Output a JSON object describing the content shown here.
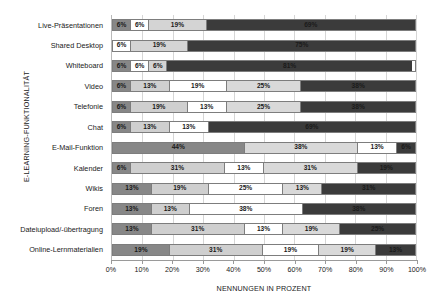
{
  "chart_data": {
    "type": "bar",
    "orientation": "horizontal",
    "stacked": true,
    "normalized_percent": true,
    "title": "",
    "xlabel": "NENNUNGEN IN PROZENT",
    "ylabel": "E-LEARNING-FUNKTIONALITÄT",
    "xlim": [
      0,
      100
    ],
    "xticks": [
      0,
      10,
      20,
      30,
      40,
      50,
      60,
      70,
      80,
      90,
      100
    ],
    "xticklabels": [
      "0%",
      "10%",
      "20%",
      "30%",
      "40%",
      "50%",
      "60%",
      "70%",
      "80%",
      "90%",
      "100%"
    ],
    "grid": true,
    "grid_axis": "x",
    "legend": false,
    "categories": [
      "Live-Präsentationen",
      "Shared Desktop",
      "Whiteboard",
      "Video",
      "Telefonie",
      "Chat",
      "E-Mail-Funktion",
      "Kalender",
      "Wikis",
      "Foren",
      "Dateiupload/-übertragung",
      "Online-Lernmaterialien"
    ],
    "series": [
      {
        "name": "series-1",
        "color": "#878787"
      },
      {
        "name": "series-2",
        "color": "#cfcfcf"
      },
      {
        "name": "series-3",
        "color": "#ffffff"
      },
      {
        "name": "series-4",
        "color": "#d9d9d9"
      },
      {
        "name": "series-5",
        "color": "#3b3b3b"
      }
    ],
    "rows": [
      {
        "category": "Live-Präsentationen",
        "segments": [
          {
            "series": 0,
            "value": 6,
            "label": "6%",
            "color": "#878787",
            "text_color": "#1a1a1a"
          },
          {
            "series": 1,
            "value": 6,
            "label": "6%",
            "color": "#ffffff",
            "text_color": "#1a1a1a"
          },
          {
            "series": 2,
            "value": 19,
            "label": "19%",
            "color": "#d4d4d4",
            "text_color": "#1a1a1a"
          },
          {
            "series": 4,
            "value": 69,
            "label": "69%",
            "color": "#3b3b3b",
            "text_color": "#1a1a1a"
          }
        ]
      },
      {
        "category": "Shared Desktop",
        "segments": [
          {
            "series": 0,
            "value": 6,
            "label": "6%",
            "color": "#ffffff",
            "text_color": "#1a1a1a"
          },
          {
            "series": 1,
            "value": 19,
            "label": "19%",
            "color": "#d4d4d4",
            "text_color": "#1a1a1a"
          },
          {
            "series": 4,
            "value": 75,
            "label": "75%",
            "color": "#3b3b3b",
            "text_color": "#1a1a1a"
          }
        ]
      },
      {
        "category": "Whiteboard",
        "segments": [
          {
            "series": 0,
            "value": 6,
            "label": "6%",
            "color": "#878787",
            "text_color": "#1a1a1a"
          },
          {
            "series": 1,
            "value": 6,
            "label": "6%",
            "color": "#ffffff",
            "text_color": "#1a1a1a"
          },
          {
            "series": 2,
            "value": 6,
            "label": "6%",
            "color": "#d4d4d4",
            "text_color": "#1a1a1a"
          },
          {
            "series": 4,
            "value": 81,
            "label": "81%",
            "color": "#3b3b3b",
            "text_color": "#1a1a1a"
          }
        ]
      },
      {
        "category": "Video",
        "segments": [
          {
            "series": 0,
            "value": 6,
            "label": "6%",
            "color": "#878787",
            "text_color": "#1a1a1a"
          },
          {
            "series": 1,
            "value": 13,
            "label": "13%",
            "color": "#cfcfcf",
            "text_color": "#1a1a1a"
          },
          {
            "series": 2,
            "value": 19,
            "label": "19%",
            "color": "#ffffff",
            "text_color": "#1a1a1a"
          },
          {
            "series": 3,
            "value": 25,
            "label": "25%",
            "color": "#d9d9d9",
            "text_color": "#1a1a1a"
          },
          {
            "series": 4,
            "value": 38,
            "label": "38%",
            "color": "#3b3b3b",
            "text_color": "#1a1a1a"
          }
        ]
      },
      {
        "category": "Telefonie",
        "segments": [
          {
            "series": 0,
            "value": 6,
            "label": "6%",
            "color": "#878787",
            "text_color": "#1a1a1a"
          },
          {
            "series": 1,
            "value": 19,
            "label": "19%",
            "color": "#cfcfcf",
            "text_color": "#1a1a1a"
          },
          {
            "series": 2,
            "value": 13,
            "label": "13%",
            "color": "#ffffff",
            "text_color": "#1a1a1a"
          },
          {
            "series": 3,
            "value": 25,
            "label": "25%",
            "color": "#d9d9d9",
            "text_color": "#1a1a1a"
          },
          {
            "series": 4,
            "value": 38,
            "label": "38%",
            "color": "#3b3b3b",
            "text_color": "#1a1a1a"
          }
        ]
      },
      {
        "category": "Chat",
        "segments": [
          {
            "series": 0,
            "value": 6,
            "label": "6%",
            "color": "#878787",
            "text_color": "#1a1a1a"
          },
          {
            "series": 1,
            "value": 13,
            "label": "13%",
            "color": "#cfcfcf",
            "text_color": "#1a1a1a"
          },
          {
            "series": 2,
            "value": 13,
            "label": "13%",
            "color": "#ffffff",
            "text_color": "#1a1a1a"
          },
          {
            "series": 4,
            "value": 69,
            "label": "69%",
            "color": "#3b3b3b",
            "text_color": "#1a1a1a"
          }
        ]
      },
      {
        "category": "E-Mail-Funktion",
        "segments": [
          {
            "series": 0,
            "value": 44,
            "label": "44%",
            "color": "#878787",
            "text_color": "#1a1a1a"
          },
          {
            "series": 1,
            "value": 38,
            "label": "38%",
            "color": "#d9d9d9",
            "text_color": "#1a1a1a"
          },
          {
            "series": 2,
            "value": 13,
            "label": "13%",
            "color": "#ffffff",
            "text_color": "#1a1a1a"
          },
          {
            "series": 4,
            "value": 6,
            "label": "6%",
            "color": "#3b3b3b",
            "text_color": "#1a1a1a"
          }
        ]
      },
      {
        "category": "Kalender",
        "segments": [
          {
            "series": 0,
            "value": 6,
            "label": "6%",
            "color": "#878787",
            "text_color": "#1a1a1a"
          },
          {
            "series": 1,
            "value": 31,
            "label": "31%",
            "color": "#cfcfcf",
            "text_color": "#1a1a1a"
          },
          {
            "series": 2,
            "value": 13,
            "label": "13%",
            "color": "#ffffff",
            "text_color": "#1a1a1a"
          },
          {
            "series": 3,
            "value": 31,
            "label": "31%",
            "color": "#d9d9d9",
            "text_color": "#1a1a1a"
          },
          {
            "series": 4,
            "value": 19,
            "label": "19%",
            "color": "#3b3b3b",
            "text_color": "#1a1a1a"
          }
        ]
      },
      {
        "category": "Wikis",
        "segments": [
          {
            "series": 0,
            "value": 13,
            "label": "13%",
            "color": "#878787",
            "text_color": "#1a1a1a"
          },
          {
            "series": 1,
            "value": 19,
            "label": "19%",
            "color": "#cfcfcf",
            "text_color": "#1a1a1a"
          },
          {
            "series": 2,
            "value": 25,
            "label": "25%",
            "color": "#ffffff",
            "text_color": "#1a1a1a"
          },
          {
            "series": 3,
            "value": 13,
            "label": "13%",
            "color": "#d9d9d9",
            "text_color": "#1a1a1a"
          },
          {
            "series": 4,
            "value": 31,
            "label": "31%",
            "color": "#3b3b3b",
            "text_color": "#1a1a1a"
          }
        ]
      },
      {
        "category": "Foren",
        "segments": [
          {
            "series": 0,
            "value": 13,
            "label": "13%",
            "color": "#878787",
            "text_color": "#1a1a1a"
          },
          {
            "series": 1,
            "value": 13,
            "label": "13%",
            "color": "#cfcfcf",
            "text_color": "#1a1a1a"
          },
          {
            "series": 2,
            "value": 38,
            "label": "38%",
            "color": "#ffffff",
            "text_color": "#1a1a1a"
          },
          {
            "series": 4,
            "value": 38,
            "label": "38%",
            "color": "#3b3b3b",
            "text_color": "#1a1a1a"
          }
        ]
      },
      {
        "category": "Dateiupload/-übertragung",
        "segments": [
          {
            "series": 0,
            "value": 13,
            "label": "13%",
            "color": "#878787",
            "text_color": "#1a1a1a"
          },
          {
            "series": 1,
            "value": 31,
            "label": "31%",
            "color": "#cfcfcf",
            "text_color": "#1a1a1a"
          },
          {
            "series": 2,
            "value": 13,
            "label": "13%",
            "color": "#ffffff",
            "text_color": "#1a1a1a"
          },
          {
            "series": 3,
            "value": 19,
            "label": "19%",
            "color": "#d9d9d9",
            "text_color": "#1a1a1a"
          },
          {
            "series": 4,
            "value": 25,
            "label": "25%",
            "color": "#3b3b3b",
            "text_color": "#1a1a1a"
          }
        ]
      },
      {
        "category": "Online-Lernmaterialien",
        "segments": [
          {
            "series": 0,
            "value": 19,
            "label": "19%",
            "color": "#878787",
            "text_color": "#1a1a1a"
          },
          {
            "series": 1,
            "value": 31,
            "label": "31%",
            "color": "#cfcfcf",
            "text_color": "#1a1a1a"
          },
          {
            "series": 2,
            "value": 19,
            "label": "19%",
            "color": "#ffffff",
            "text_color": "#1a1a1a"
          },
          {
            "series": 3,
            "value": 19,
            "label": "19%",
            "color": "#d9d9d9",
            "text_color": "#1a1a1a"
          },
          {
            "series": 4,
            "value": 13,
            "label": "13%",
            "color": "#3b3b3b",
            "text_color": "#1a1a1a"
          }
        ]
      }
    ]
  }
}
